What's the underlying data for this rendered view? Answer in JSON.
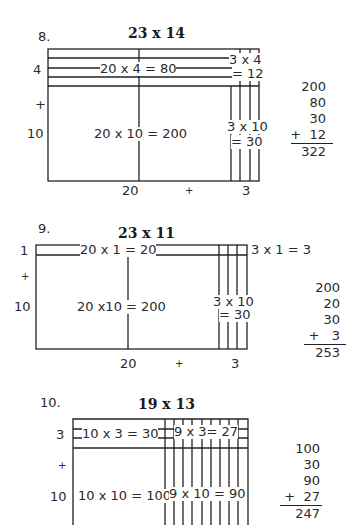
{
  "problems": [
    {
      "number": "8.",
      "title": "23 x 14",
      "row_labels": {
        "top": "4",
        "plus": "+",
        "bottom": "10"
      },
      "col_labels": {
        "left": "20",
        "plus": "+",
        "right": "3"
      },
      "cells": {
        "top_left": "20 x 4 = 80",
        "top_right_a": "3 x 4",
        "top_right_b": "= 12",
        "bottom_left": "20 x 10 = 200",
        "bottom_right_a": "3 x 10",
        "bottom_right_b": "= 30"
      },
      "sum": {
        "lines": [
          "200",
          "80",
          "30",
          "+  12"
        ],
        "total": "322"
      }
    },
    {
      "number": "9.",
      "title": "23 x 11",
      "row_labels": {
        "top": "1",
        "plus": "+",
        "bottom": "10"
      },
      "col_labels": {
        "left": "20",
        "plus": "+",
        "right": "3"
      },
      "cells": {
        "top_left": "20 x 1 = 20",
        "top_right": "3 x 1 = 3",
        "bottom_left": "20 x10 = 200",
        "bottom_right_a": "3 x 10",
        "bottom_right_b": "= 30"
      },
      "sum": {
        "lines": [
          "200",
          "20",
          "30",
          "+   3"
        ],
        "total": "253"
      }
    },
    {
      "number": "10.",
      "title": "19 x 13",
      "row_labels": {
        "top": "3",
        "plus": "+",
        "bottom": "10"
      },
      "cells": {
        "top_left": "10 x 3 = 30",
        "top_right": "9 x 3= 27",
        "bottom_left": "10 x 10 = 100",
        "bottom_right": "9 x 10 = 90"
      },
      "sum": {
        "lines": [
          "100",
          "30",
          "90",
          "+  27"
        ],
        "total": "247"
      }
    }
  ]
}
